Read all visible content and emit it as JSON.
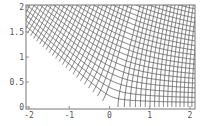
{
  "chart_data": {
    "type": "line",
    "title": "",
    "xlabel": "",
    "ylabel": "",
    "xlim": [
      -2,
      2
    ],
    "ylim": [
      0,
      2
    ],
    "grid": false,
    "legend": null,
    "mapping_model": "z = w^(4/5), w on a square grid",
    "x_ticks": [
      {
        "value": -2,
        "label": "-2"
      },
      {
        "value": -1,
        "label": "-1"
      },
      {
        "value": 0,
        "label": "0"
      },
      {
        "value": 1,
        "label": "1"
      },
      {
        "value": 2,
        "label": "2"
      }
    ],
    "y_ticks": [
      {
        "value": 0,
        "label": "0"
      },
      {
        "value": 0.5,
        "label": "0.5"
      },
      {
        "value": 1,
        "label": "1"
      },
      {
        "value": 1.5,
        "label": "1.5"
      },
      {
        "value": 2,
        "label": "2"
      }
    ],
    "line_color": "#555555",
    "frame_color": "#777777",
    "grid_step": 0.24,
    "grid_count": 26
  }
}
